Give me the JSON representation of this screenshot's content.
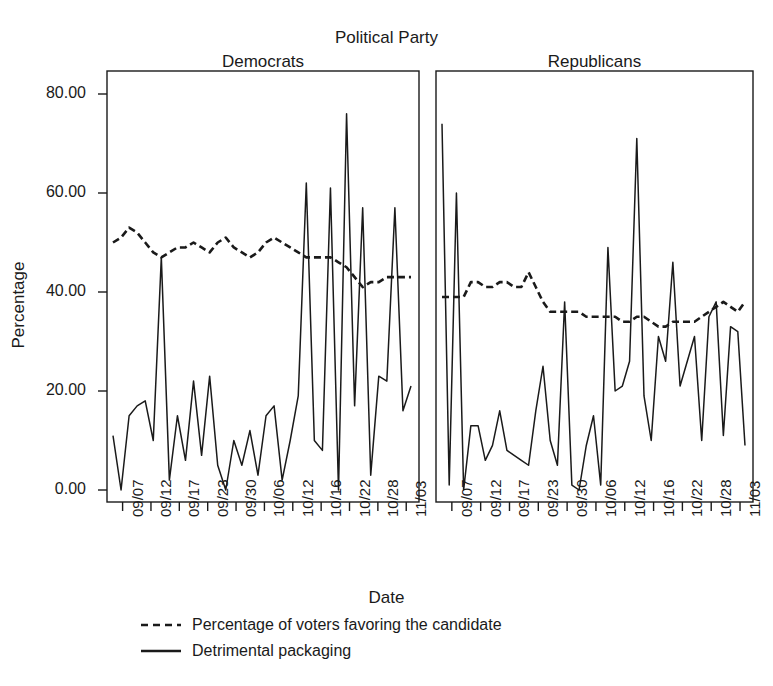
{
  "chart_data": {
    "type": "line",
    "title": "Political Party",
    "xlabel": "Date",
    "ylabel": "Percentage",
    "ylim": [
      0,
      80
    ],
    "yticks": [
      0,
      20,
      40,
      60,
      80
    ],
    "ytick_labels": [
      "0.00",
      "20.00",
      "40.00",
      "60.00",
      "80.00"
    ],
    "xtick_labels": [
      "09/07",
      "09/12",
      "09/17",
      "09/23",
      "09/30",
      "10/06",
      "10/12",
      "10/16",
      "10/22",
      "10/28",
      "11/03"
    ],
    "grid": false,
    "legend_position": "bottom-left",
    "legend": [
      {
        "key": "dashed",
        "label": "Percentage of voters favoring the candidate"
      },
      {
        "key": "solid",
        "label": "Detrimental packaging"
      }
    ],
    "panels": [
      {
        "name": "Democrats",
        "series": [
          {
            "name": "Detrimental packaging",
            "style": "solid",
            "values": [
              11,
              0,
              15,
              17,
              18,
              10,
              47,
              2,
              15,
              6,
              22,
              7,
              23,
              5,
              0,
              10,
              5,
              12,
              3,
              15,
              17,
              2,
              10,
              19,
              62,
              10,
              8,
              61,
              0,
              76,
              17,
              57,
              3,
              23,
              22,
              57,
              16,
              21
            ]
          },
          {
            "name": "Percentage of voters favoring the candidate",
            "style": "dashed",
            "values": [
              50,
              51,
              53,
              52,
              50,
              48,
              47,
              48,
              49,
              49,
              50,
              49,
              48,
              50,
              51,
              49,
              48,
              47,
              48,
              50,
              51,
              50,
              49,
              48,
              47,
              47,
              47,
              47,
              46,
              45,
              43,
              41,
              42,
              42,
              43,
              43,
              43,
              43
            ]
          }
        ]
      },
      {
        "name": "Republicans",
        "series": [
          {
            "name": "Detrimental packaging",
            "style": "solid",
            "values": [
              74,
              1,
              60,
              0,
              13,
              13,
              6,
              9,
              16,
              8,
              7,
              6,
              5,
              16,
              25,
              10,
              5,
              38,
              1,
              0,
              9,
              15,
              1,
              49,
              20,
              21,
              26,
              71,
              19,
              10,
              31,
              26,
              46,
              21,
              26,
              31,
              10,
              35,
              38,
              11,
              33,
              32,
              9
            ]
          },
          {
            "name": "Percentage of voters favoring the candidate",
            "style": "dashed",
            "values": [
              39,
              39,
              39,
              39,
              42,
              42,
              41,
              41,
              42,
              42,
              41,
              41,
              44,
              41,
              38,
              36,
              36,
              36,
              36,
              36,
              35,
              35,
              35,
              35,
              35,
              34,
              34,
              35,
              35,
              34,
              33,
              33,
              34,
              34,
              34,
              34,
              35,
              36,
              37,
              38,
              37,
              36,
              38
            ]
          }
        ]
      }
    ]
  }
}
